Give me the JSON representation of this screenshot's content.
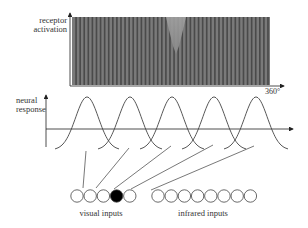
{
  "receptor_panel": {
    "ylabel_line1": "receptor",
    "ylabel_line2": "activation",
    "x_end_label": "360°",
    "stripe_count": 48,
    "fill_color": "#7a7a7a",
    "stripe_color": "#4a4a4a",
    "notch_color": "#9a9a9a",
    "notch_center_fraction": 0.5
  },
  "response_panel": {
    "ylabel_line1": "neural",
    "ylabel_line2": "response",
    "tuning_curve_count": 5,
    "curve_color": "#444444"
  },
  "inputs": {
    "visual_label": "visual inputs",
    "infrared_label": "infrared inputs",
    "visual_count": 5,
    "infrared_count": 8,
    "active_visual_index": 3
  },
  "colors": {
    "line": "#444444",
    "axis": "#222222",
    "text": "#333333",
    "active_node": "#000000"
  }
}
